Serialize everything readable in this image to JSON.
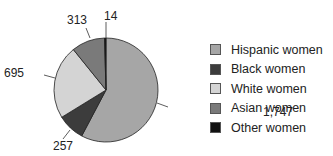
{
  "chart_data": {
    "type": "pie",
    "title": "",
    "categories": [
      "Hispanic women",
      "Black women",
      "White women",
      "Asian women",
      "Other women"
    ],
    "values": [
      1747,
      257,
      695,
      313,
      14
    ],
    "colors": [
      "#a6a6a6",
      "#3c3c3c",
      "#d4d4d4",
      "#7a7a7a",
      "#111111"
    ],
    "data_labels": [
      "1,747",
      "257",
      "695",
      "313",
      "14"
    ],
    "start_angle": "12 o'clock",
    "direction": "clockwise",
    "legend_position": "right"
  },
  "legend": {
    "items": [
      {
        "label": "Hispanic women",
        "color": "#a6a6a6"
      },
      {
        "label": "Black women",
        "color": "#3c3c3c"
      },
      {
        "label": "White women",
        "color": "#d4d4d4"
      },
      {
        "label": "Asian women",
        "color": "#7a7a7a"
      },
      {
        "label": "Other women",
        "color": "#111111"
      }
    ]
  }
}
